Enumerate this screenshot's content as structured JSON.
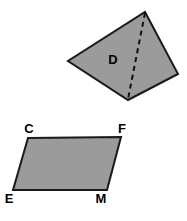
{
  "figure": {
    "background_color": "#ffffff",
    "fill_color": "#9b9b9b",
    "stroke_color": "#1a1a1a",
    "label_color": "#000000",
    "shapes": [
      {
        "id": "quadrilateral-d",
        "kind": "quadrilateral",
        "interior_label": "D",
        "interior_label_x": 113,
        "interior_label_y": 64,
        "points": "145,12 178,74 128,100 68,61",
        "vertices": [
          {
            "x": 145,
            "y": 12
          },
          {
            "x": 178,
            "y": 74
          },
          {
            "x": 128,
            "y": 100
          },
          {
            "x": 68,
            "y": 61
          }
        ],
        "diagonal": {
          "label": "dashed-diagonal",
          "x1": 145,
          "y1": 13,
          "x2": 128,
          "y2": 99,
          "style": "dashed"
        }
      },
      {
        "id": "parallelogram-cfme",
        "kind": "parallelogram",
        "points": "28,138 121,137 107,190 13,190",
        "vertices": [
          {
            "name": "C",
            "x": 28,
            "y": 138,
            "label_x": 29,
            "label_y": 133
          },
          {
            "name": "F",
            "x": 121,
            "y": 137,
            "label_x": 122,
            "label_y": 133
          },
          {
            "name": "M",
            "x": 107,
            "y": 190,
            "label_x": 101,
            "label_y": 203
          },
          {
            "name": "E",
            "x": 13,
            "y": 190,
            "label_x": 9,
            "label_y": 203
          }
        ]
      }
    ]
  }
}
